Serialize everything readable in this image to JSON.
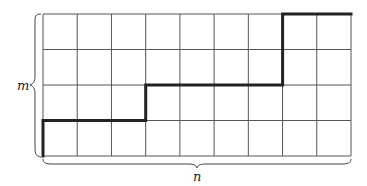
{
  "diagram": {
    "grid": {
      "columns": 9,
      "rows": 4,
      "x0": 43,
      "y0": 14,
      "x1": 351,
      "y1": 156,
      "line_color": "#555555",
      "line_width": 1
    },
    "path": {
      "color": "#222222",
      "width": 3,
      "points_grid": [
        [
          0,
          0
        ],
        [
          0,
          1
        ],
        [
          3,
          1
        ],
        [
          3,
          2
        ],
        [
          7,
          2
        ],
        [
          7,
          4
        ],
        [
          9,
          4
        ]
      ]
    },
    "braces": {
      "left": {
        "label": "m",
        "label_x": 17,
        "label_y": 79
      },
      "bottom": {
        "label": "n",
        "label_x": 193,
        "label_y": 170
      }
    }
  }
}
